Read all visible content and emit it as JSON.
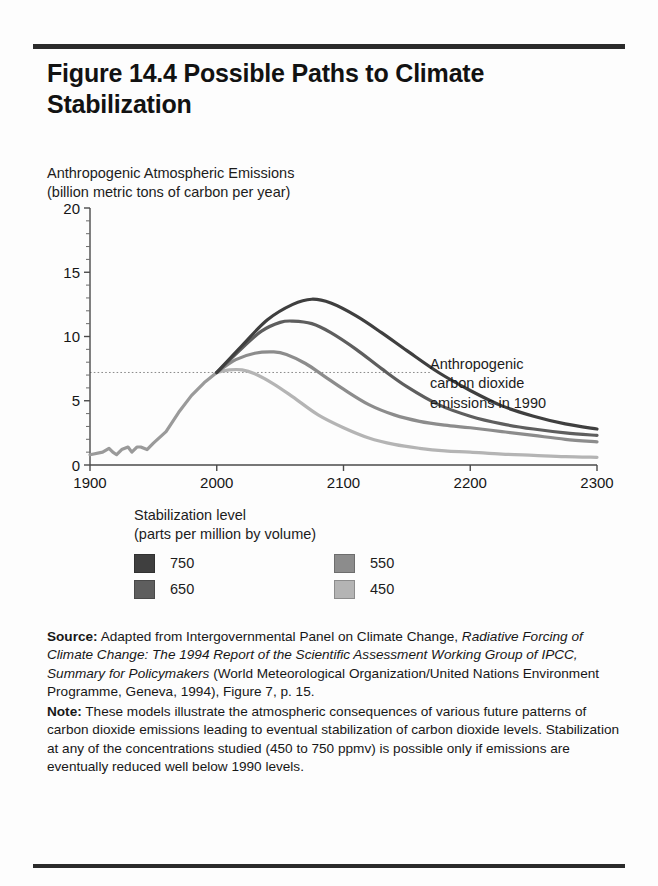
{
  "figure": {
    "title": "Figure 14.4  Possible Paths to Climate Stabilization",
    "y_axis_caption_line1": "Anthropogenic Atmospheric Emissions",
    "y_axis_caption_line2": "(billion metric tons of carbon per year)",
    "annotation_line1": "Anthropogenic",
    "annotation_line2": "carbon dioxide",
    "annotation_line3": "emissions in 1990"
  },
  "legend": {
    "title_line1": "Stabilization level",
    "title_line2": "(parts per million by volume)",
    "items": [
      {
        "label": "750",
        "color": "#3f3f3f"
      },
      {
        "label": "550",
        "color": "#8c8c8c"
      },
      {
        "label": "650",
        "color": "#5e5e5e"
      },
      {
        "label": "450",
        "color": "#b4b4b4"
      }
    ]
  },
  "notes": {
    "source_label": "Source:",
    "source_text_1": " Adapted from Intergovernmental Panel on Climate Change, ",
    "source_italic": "Radiative Forcing of Climate Change: The 1994 Report of the Scientific Assessment Working Group of IPCC, Summary for Policymakers",
    "source_text_2": " (World Meteorological Organization/United Nations Environment Programme, Geneva, 1994), Figure 7, p. 15.",
    "note_label": "Note:",
    "note_text": " These models illustrate the atmospheric consequences of various future patterns of carbon dioxide emissions leading to eventual stabilization of carbon dioxide levels. Stabilization at any of the concentrations studied (450 to 750 ppmv) is possible only if emissions are eventually reduced well below 1990 levels."
  },
  "chart_data": {
    "type": "line",
    "title": "Figure 14.4  Possible Paths to Climate Stabilization",
    "xlabel": "",
    "ylabel": "Anthropogenic Atmospheric Emissions (billion metric tons of carbon per year)",
    "xlim": [
      1900,
      2300
    ],
    "ylim": [
      0,
      20
    ],
    "xticks": [
      1900,
      2000,
      2100,
      2200,
      2300
    ],
    "yticks": [
      0,
      5,
      10,
      15,
      20
    ],
    "yminorticks": [
      1,
      2,
      3,
      4,
      6,
      7,
      8,
      9,
      11,
      12,
      13,
      14,
      16,
      17,
      18,
      19
    ],
    "grid": false,
    "legend_position": "below-plot",
    "reference_line": {
      "label": "Anthropogenic carbon dioxide emissions in 1990",
      "y_value": 7.2,
      "style": "dotted"
    },
    "historical": {
      "name": "Historical emissions",
      "color": "#9a9a9a",
      "x": [
        1900,
        1910,
        1915,
        1918,
        1921,
        1925,
        1930,
        1933,
        1937,
        1940,
        1945,
        1950,
        1960,
        1970,
        1980,
        1990,
        2000
      ],
      "y": [
        0.8,
        1.0,
        1.3,
        1.0,
        0.8,
        1.2,
        1.4,
        1.0,
        1.4,
        1.4,
        1.2,
        1.7,
        2.6,
        4.1,
        5.4,
        6.4,
        7.2
      ]
    },
    "series": [
      {
        "name": "750",
        "color": "#3f3f3f",
        "x": [
          2000,
          2020,
          2040,
          2060,
          2075,
          2090,
          2110,
          2130,
          2150,
          2175,
          2200,
          2225,
          2250,
          2275,
          2300
        ],
        "y": [
          7.2,
          9.3,
          11.3,
          12.5,
          12.9,
          12.6,
          11.6,
          10.3,
          8.9,
          7.2,
          5.8,
          4.6,
          3.8,
          3.2,
          2.8
        ]
      },
      {
        "name": "650",
        "color": "#5e5e5e",
        "x": [
          2000,
          2020,
          2035,
          2050,
          2060,
          2075,
          2090,
          2110,
          2130,
          2150,
          2175,
          2200,
          2225,
          2250,
          2275,
          2300
        ],
        "y": [
          7.2,
          9.1,
          10.4,
          11.1,
          11.2,
          11.0,
          10.3,
          9.0,
          7.5,
          6.1,
          4.7,
          3.8,
          3.2,
          2.8,
          2.5,
          2.3
        ]
      },
      {
        "name": "550",
        "color": "#8c8c8c",
        "x": [
          2000,
          2015,
          2030,
          2045,
          2055,
          2070,
          2085,
          2100,
          2120,
          2140,
          2160,
          2180,
          2200,
          2225,
          2250,
          2275,
          2300
        ],
        "y": [
          7.2,
          8.2,
          8.7,
          8.8,
          8.6,
          7.9,
          6.9,
          5.9,
          4.7,
          3.9,
          3.4,
          3.1,
          2.9,
          2.6,
          2.3,
          2.0,
          1.8
        ]
      },
      {
        "name": "450",
        "color": "#b4b4b4",
        "x": [
          2000,
          2010,
          2020,
          2030,
          2045,
          2060,
          2080,
          2100,
          2120,
          2140,
          2160,
          2180,
          2200,
          2225,
          2250,
          2275,
          2300
        ],
        "y": [
          7.2,
          7.4,
          7.4,
          7.1,
          6.3,
          5.3,
          3.9,
          2.9,
          2.1,
          1.6,
          1.3,
          1.1,
          1.0,
          0.85,
          0.75,
          0.65,
          0.6
        ]
      }
    ]
  }
}
